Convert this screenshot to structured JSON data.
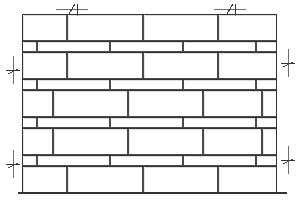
{
  "drawing": {
    "title": "Brick Wall Elevation",
    "type": "architectural-elevation",
    "width": 303,
    "height": 208,
    "background_color": "#ffffff",
    "line_color": "#4a4a4a",
    "heavy_line_color": "#333333",
    "mortar_fill": "#fdfdfd",
    "brick_fill": "#ffffff",
    "shadow_color": "#9a9a9a"
  },
  "wall": {
    "left": 22,
    "right": 277,
    "top": 14,
    "bottom": 193,
    "thick_course_height": 27,
    "thin_course_height": 11,
    "description": "Running bond masonry elevation with alternating tall stretcher courses and thin header courses",
    "courses": [
      {
        "index": 0,
        "kind": "thick",
        "y": 14,
        "height": 27,
        "joints": [
          22,
          67,
          143,
          218,
          277
        ],
        "note": "top stretcher course"
      },
      {
        "index": 1,
        "kind": "thin",
        "y": 41,
        "height": 11,
        "joints": [
          22,
          37,
          110,
          183,
          256,
          277
        ],
        "note": "thin header course"
      },
      {
        "index": 2,
        "kind": "thick",
        "y": 52,
        "height": 27,
        "joints": [
          22,
          67,
          143,
          218,
          277
        ],
        "note": "stretcher course"
      },
      {
        "index": 3,
        "kind": "thin",
        "y": 79,
        "height": 11,
        "joints": [
          22,
          37,
          110,
          183,
          256,
          277
        ],
        "note": "thin header course"
      },
      {
        "index": 4,
        "kind": "thick",
        "y": 90,
        "height": 27,
        "joints": [
          22,
          53,
          128,
          203,
          262,
          277
        ],
        "note": "stretcher course offset"
      },
      {
        "index": 5,
        "kind": "thin",
        "y": 117,
        "height": 11,
        "joints": [
          22,
          37,
          110,
          183,
          256,
          277
        ],
        "note": "thin header course"
      },
      {
        "index": 6,
        "kind": "thick",
        "y": 128,
        "height": 27,
        "joints": [
          22,
          53,
          128,
          203,
          262,
          277
        ],
        "note": "stretcher course offset"
      },
      {
        "index": 7,
        "kind": "thin",
        "y": 155,
        "height": 11,
        "joints": [
          22,
          37,
          110,
          183,
          256,
          277
        ],
        "note": "thin header course"
      },
      {
        "index": 8,
        "kind": "thick",
        "y": 166,
        "height": 27,
        "joints": [
          22,
          67,
          143,
          218,
          277
        ],
        "note": "bottom stretcher course"
      }
    ]
  },
  "dimensions": {
    "tick_style": "slash-with-crossbar",
    "horizontal": [
      {
        "name": "top-dimension-tick-left",
        "x": 72,
        "y": 9,
        "orientation": "horizontal"
      },
      {
        "name": "top-dimension-tick-right",
        "x": 230,
        "y": 9,
        "orientation": "horizontal"
      }
    ],
    "vertical": [
      {
        "name": "left-dimension-tick-upper",
        "x": 13,
        "y": 70,
        "orientation": "vertical"
      },
      {
        "name": "left-dimension-tick-lower",
        "x": 13,
        "y": 164,
        "orientation": "vertical"
      },
      {
        "name": "right-dimension-tick-upper",
        "x": 288,
        "y": 63,
        "orientation": "vertical"
      },
      {
        "name": "right-dimension-tick-lower",
        "x": 288,
        "y": 160,
        "orientation": "vertical"
      }
    ]
  },
  "annotations": {
    "speckles": [
      {
        "x": 92,
        "y": 26
      },
      {
        "x": 170,
        "y": 30
      },
      {
        "x": 246,
        "y": 24
      },
      {
        "x": 196,
        "y": 46
      },
      {
        "x": 60,
        "y": 58
      },
      {
        "x": 231,
        "y": 64
      },
      {
        "x": 82,
        "y": 85
      },
      {
        "x": 258,
        "y": 86
      },
      {
        "x": 147,
        "y": 101
      },
      {
        "x": 190,
        "y": 96
      },
      {
        "x": 272,
        "y": 108
      },
      {
        "x": 76,
        "y": 122
      },
      {
        "x": 235,
        "y": 118
      },
      {
        "x": 123,
        "y": 140
      },
      {
        "x": 201,
        "y": 148
      },
      {
        "x": 95,
        "y": 162
      },
      {
        "x": 170,
        "y": 158
      },
      {
        "x": 262,
        "y": 170
      },
      {
        "x": 138,
        "y": 180
      },
      {
        "x": 210,
        "y": 176
      },
      {
        "x": 48,
        "y": 176
      }
    ]
  }
}
